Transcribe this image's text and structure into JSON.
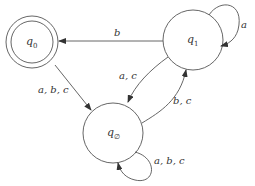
{
  "diagram": {
    "type": "finite-automaton",
    "states": [
      {
        "id": "q0",
        "label": "q",
        "subscript": "0",
        "accepting": true
      },
      {
        "id": "q1",
        "label": "q",
        "subscript": "1",
        "accepting": false
      },
      {
        "id": "qempty",
        "label": "q",
        "subscript": "∅",
        "accepting": false
      }
    ],
    "transitions": [
      {
        "from": "q1",
        "to": "q0",
        "label": "b"
      },
      {
        "from": "q1",
        "to": "q1",
        "label": "a"
      },
      {
        "from": "q0",
        "to": "qempty",
        "label": "a, b, c"
      },
      {
        "from": "q1",
        "to": "qempty",
        "label": "a, c"
      },
      {
        "from": "qempty",
        "to": "q1",
        "label": "b, c"
      },
      {
        "from": "qempty",
        "to": "qempty",
        "label": "a, b, c"
      }
    ]
  }
}
